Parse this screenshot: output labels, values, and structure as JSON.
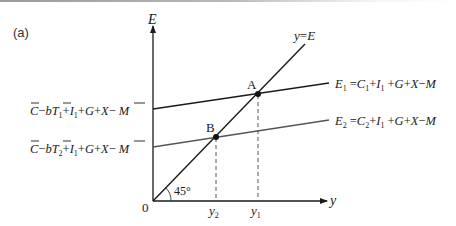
{
  "figure": {
    "panel_label": "(a)",
    "axes": {
      "y_axis_label": "E",
      "x_axis_label": "y",
      "origin_label": "0",
      "angle_label": "45°"
    },
    "lines": {
      "diagonal": {
        "label": "y = E",
        "label_y": "y",
        "label_eq": "=",
        "label_E": "E"
      },
      "e1": {
        "label": "E1 = C1 + I1 + G + X − M",
        "intercept_label": "C̄ − bT̄1 + I1 + G + X − M̄"
      },
      "e2": {
        "label": "E2 = C2 + I1 + G + X − M",
        "intercept_label": "C̄ − bT̄2 + I1 + G + X − M̄"
      }
    },
    "points": {
      "a": {
        "label": "A"
      },
      "b": {
        "label": "B"
      }
    },
    "x_ticks": {
      "y2": {
        "base": "y",
        "sub": "2"
      },
      "y1": {
        "base": "y",
        "sub": "1"
      }
    },
    "colors": {
      "e1_line": "#1a1a1a",
      "e2_line": "#555555",
      "axis": "#1a1a1a",
      "dashed": "#444444"
    }
  }
}
